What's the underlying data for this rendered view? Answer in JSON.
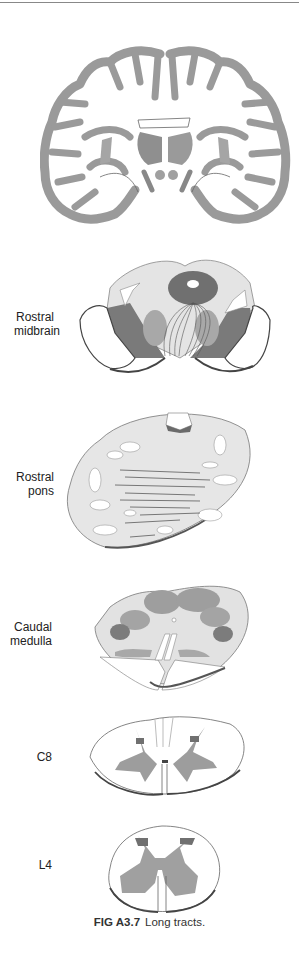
{
  "figure": {
    "caption_id": "FIG A3.7",
    "caption_text": "Long tracts."
  },
  "panels": [
    {
      "id": "coronal-brain",
      "label": ""
    },
    {
      "id": "rostral-midbrain",
      "label_line1": "Rostral",
      "label_line2": "midbrain"
    },
    {
      "id": "rostral-pons",
      "label_line1": "Rostral",
      "label_line2": "pons"
    },
    {
      "id": "caudal-medulla",
      "label_line1": "Caudal",
      "label_line2": "medulla"
    },
    {
      "id": "c8",
      "label_line1": "C8"
    },
    {
      "id": "l4",
      "label_line1": "L4"
    }
  ],
  "colors": {
    "light_fill": "#e4e4e4",
    "mid_gray": "#a9a9a9",
    "dark_gray": "#7a7a7a",
    "outline": "#555555",
    "shadow": "#4a4a4a"
  }
}
